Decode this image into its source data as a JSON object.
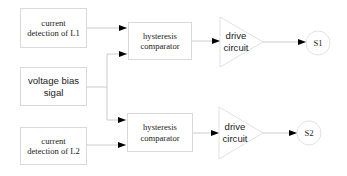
{
  "diagram": {
    "inputs": [
      {
        "id": "l1",
        "label_line1": "current",
        "label_line2": "detection of L1"
      },
      {
        "id": "bias",
        "label_line1": "voltage bias",
        "label_line2": "sigal"
      },
      {
        "id": "l2",
        "label_line1": "current",
        "label_line2": "detection of L2"
      }
    ],
    "comparators": [
      {
        "id": "comp1",
        "label_line1": "hysteresis",
        "label_line2": "comparator"
      },
      {
        "id": "comp2",
        "label_line1": "hysteresis",
        "label_line2": "comparator"
      }
    ],
    "drivers": [
      {
        "id": "drv1",
        "label_line1": "drive",
        "label_line2": "circuit"
      },
      {
        "id": "drv2",
        "label_line1": "drive",
        "label_line2": "circuit"
      }
    ],
    "outputs": [
      {
        "id": "s1",
        "label": "S1"
      },
      {
        "id": "s2",
        "label": "S2"
      }
    ],
    "connections": [
      {
        "from": "l1",
        "to": "comp1"
      },
      {
        "from": "bias",
        "to": "comp1"
      },
      {
        "from": "bias",
        "to": "comp2"
      },
      {
        "from": "l2",
        "to": "comp2"
      },
      {
        "from": "comp1",
        "to": "drv1"
      },
      {
        "from": "comp2",
        "to": "drv2"
      },
      {
        "from": "drv1",
        "to": "s1"
      },
      {
        "from": "drv2",
        "to": "s2"
      }
    ],
    "colors": {
      "stroke": "#d9d9d9",
      "line": "#bfbfbf",
      "arrow": "#000000",
      "text": "#222222"
    }
  }
}
